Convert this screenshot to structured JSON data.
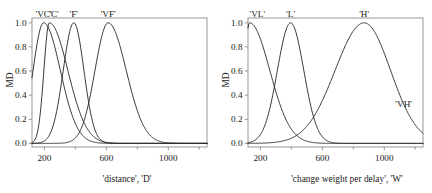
{
  "chart_data": [
    {
      "type": "line",
      "title": "",
      "panel": "left",
      "xlabel": "'distance', 'D'",
      "ylabel": "MD",
      "xlim": [
        120,
        1250
      ],
      "ylim": [
        -0.03,
        1.04
      ],
      "xticks": [
        200,
        600,
        1000
      ],
      "xticklabels": [
        "200",
        "600",
        "1000"
      ],
      "xminorticks": [
        400,
        800,
        1200
      ],
      "yticks": [
        0.0,
        0.2,
        0.4,
        0.6,
        0.8,
        1.0
      ],
      "yticklabels": [
        "0.0",
        "0.2",
        "0.4",
        "0.6",
        "0.8",
        "1.0"
      ],
      "grid": false,
      "legend": "inline-annotations",
      "series": [
        {
          "name": "'VC'",
          "label": "'VC'",
          "label_x": 195,
          "label_y": 1.0,
          "peak": 195,
          "peak_value": 1.0,
          "left_width": 120,
          "right_width": 190,
          "value_at_left_edge": 0.72
        },
        {
          "name": "'C'",
          "label": "'C'",
          "label_x": 262,
          "label_y": 1.0,
          "peak": 232,
          "peak_value": 1.0,
          "left_width": 62,
          "right_width": 210
        },
        {
          "name": "'F'",
          "label": "'F'",
          "label_x": 390,
          "label_y": 1.0,
          "peak": 390,
          "peak_value": 1.0,
          "left_width": 120,
          "right_width": 115
        },
        {
          "name": "'VF'",
          "label": "'VF'",
          "label_x": 612,
          "label_y": 1.0,
          "peak": 612,
          "peak_value": 1.0,
          "left_width": 150,
          "right_width": 205
        }
      ]
    },
    {
      "type": "line",
      "title": "",
      "panel": "right",
      "xlabel": "'change weight per delay', 'W'",
      "ylabel": "MD",
      "xlim": [
        120,
        1250
      ],
      "ylim": [
        -0.03,
        1.04
      ],
      "xticks": [
        200,
        600,
        1000
      ],
      "xticklabels": [
        "200",
        "600",
        "1000"
      ],
      "xminorticks": [
        400,
        800,
        1200
      ],
      "yticks": [
        0.0,
        0.2,
        0.4,
        0.6,
        0.8,
        1.0
      ],
      "yticklabels": [
        "0.0",
        "0.2",
        "0.4",
        "0.6",
        "0.8",
        "1.0"
      ],
      "grid": false,
      "legend": "inline-annotations",
      "series": [
        {
          "name": "'VL'",
          "label": "'VL'",
          "label_x": 180,
          "label_y": 1.0,
          "peak": 130,
          "peak_value": 1.0,
          "left_width": 60,
          "right_width": 230,
          "value_at_left_edge": 1.0
        },
        {
          "name": "'L'",
          "label": "'L'",
          "label_x": 395,
          "label_y": 1.0,
          "peak": 395,
          "peak_value": 1.0,
          "left_width": 150,
          "right_width": 150
        },
        {
          "name": "'H'",
          "label": "'H'",
          "label_x": 870,
          "label_y": 1.0,
          "peak": 870,
          "peak_value": 1.0,
          "left_width": 330,
          "right_width": 300,
          "value_at_right_edge": 0.2
        },
        {
          "name": "'VH'",
          "label": "'VH'",
          "label_x": 1125,
          "label_y": 0.33,
          "annotation_only": true
        }
      ]
    }
  ],
  "panels": {
    "left": {
      "ylabel": "MD",
      "xlabel": "'distance', 'D'",
      "yticklabels": [
        "1.0",
        "0.8",
        "0.6",
        "0.4",
        "0.2",
        "0.0"
      ],
      "xticklabels": [
        "200",
        "600",
        "1000"
      ],
      "curvelabels": [
        "'VC'",
        "'C'",
        "'F'",
        "'VF'"
      ]
    },
    "right": {
      "ylabel": "MD",
      "xlabel": "'change weight per delay', 'W'",
      "yticklabels": [
        "1.0",
        "0.8",
        "0.6",
        "0.4",
        "0.2",
        "0.0"
      ],
      "xticklabels": [
        "200",
        "600",
        "1000"
      ],
      "curvelabels": [
        "'VL'",
        "'L'",
        "'H'",
        "'VH'"
      ]
    }
  },
  "colors": {
    "curve": "#2b2b2b",
    "axis": "#8c8c8c",
    "text": "#1a1a1a",
    "background": "#ffffff"
  }
}
